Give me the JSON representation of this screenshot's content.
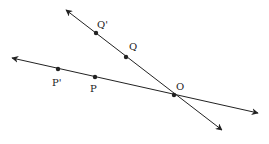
{
  "diagram": {
    "lines": [
      {
        "name": "line-OP",
        "from": [
          12,
          58
        ],
        "to": [
          258,
          113
        ]
      },
      {
        "name": "line-OQ",
        "from": [
          66,
          10
        ],
        "to": [
          222,
          130
        ]
      }
    ],
    "points": [
      {
        "name": "O",
        "label": "O",
        "x": 174,
        "y": 95,
        "lx": 176,
        "ly": 90
      },
      {
        "name": "P",
        "label": "P",
        "x": 95,
        "y": 77,
        "lx": 90,
        "ly": 92
      },
      {
        "name": "P-prime",
        "label": "P'",
        "x": 58,
        "y": 69,
        "lx": 52,
        "ly": 86
      },
      {
        "name": "Q",
        "label": "Q",
        "x": 126,
        "y": 57,
        "lx": 129,
        "ly": 50
      },
      {
        "name": "Q-prime",
        "label": "Q'",
        "x": 96,
        "y": 33,
        "lx": 97,
        "ly": 28
      }
    ],
    "color": "#222222"
  }
}
